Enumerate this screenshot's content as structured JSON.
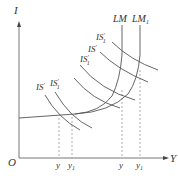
{
  "diagram": {
    "type": "IS-LM",
    "axes": {
      "y_label": "I",
      "x_label": "Y",
      "origin_label": "O"
    },
    "curves": {
      "lm": "LM",
      "lm1": "LM",
      "lm1_sub": "1"
    },
    "is_labels": [
      {
        "text": "IS",
        "prime": "'",
        "sub": ""
      },
      {
        "text": "IS",
        "prime": "'",
        "sub": "1"
      },
      {
        "text": "IS",
        "prime": "'",
        "sub": "1"
      },
      {
        "text": "IS",
        "prime": "'",
        "sub": ""
      },
      {
        "text": "IS",
        "prime": "'",
        "sub": "1"
      }
    ],
    "x_ticks": [
      {
        "text": "y",
        "sub": ""
      },
      {
        "text": "y",
        "sub": "1"
      },
      {
        "text": "y",
        "sub": ""
      },
      {
        "text": "y",
        "sub": "1"
      }
    ]
  }
}
